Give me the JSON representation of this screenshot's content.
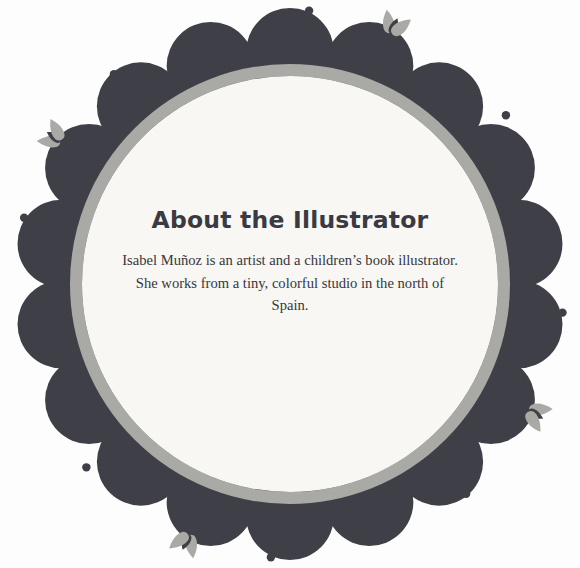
{
  "page": {
    "background_color": "#fdfdfd",
    "width": 580,
    "height": 568
  },
  "medallion": {
    "name": "decorative-floral-medallion",
    "center": {
      "x": 290,
      "y": 284
    },
    "inner_circle": {
      "fill": "#f8f7f4",
      "radius": 208
    },
    "ring": {
      "color": "#a9a9a6",
      "radius": 214,
      "stroke_width": 12
    },
    "petals": {
      "color": "#3f4047",
      "count": 18,
      "orbit_radius": 232,
      "petal_radius": 44
    },
    "dots": {
      "color": "#3f4047",
      "radius": 4.2,
      "orbit_radius": 274,
      "angles_deg": [
        -76,
        -40,
        4,
        52,
        96,
        140,
        184,
        228
      ]
    },
    "leaf_clusters": {
      "light_color": "#a9a9a6",
      "dark_color": "#3f4047",
      "orbit_radius": 268,
      "angles_deg": [
        -58,
        22,
        118,
        202
      ],
      "leaves_per_cluster": 3
    }
  },
  "content": {
    "heading": "About the Illustrator",
    "body": "Isabel Muñoz is an artist and a children’s book illustrator. She works from a tiny, colorful studio in the north of Spain.",
    "heading_color": "#3a3b42",
    "body_color": "#35363c"
  }
}
